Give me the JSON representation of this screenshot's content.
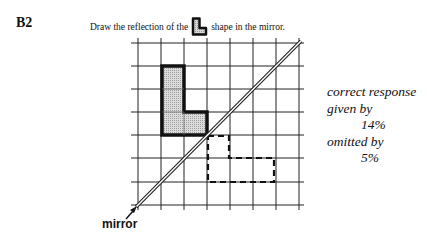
{
  "question": {
    "number": "B2",
    "instruction_before": "Draw the reflection of the",
    "instruction_icon": "l-shape-icon",
    "instruction_after": "shape in the mirror."
  },
  "figure": {
    "grid": {
      "columns": 7,
      "rows": 7
    },
    "original_shape_cells": [
      [
        1,
        1
      ],
      [
        1,
        2
      ],
      [
        1,
        3
      ],
      [
        2,
        3
      ]
    ],
    "reflected_shape_cells": [
      [
        3,
        4
      ],
      [
        3,
        5
      ],
      [
        4,
        5
      ],
      [
        5,
        5
      ]
    ],
    "mirror_label": "mirror"
  },
  "stats": {
    "line1": "correct response",
    "line2": "given by",
    "correct_pct": "14%",
    "line4": "omitted by",
    "omitted_pct": "5%"
  }
}
